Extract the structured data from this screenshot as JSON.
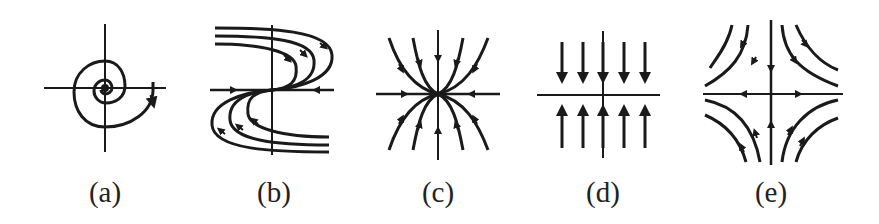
{
  "figure": {
    "panels": [
      {
        "id": "a",
        "label": "(a)",
        "label_x": 105,
        "label_y": 176,
        "type": "spiral-sink"
      },
      {
        "id": "b",
        "label": "(b)",
        "label_x": 274,
        "label_y": 176,
        "type": "saddle-node"
      },
      {
        "id": "c",
        "label": "(c)",
        "label_x": 438,
        "label_y": 176,
        "type": "stable-node"
      },
      {
        "id": "d",
        "label": "(d)",
        "label_x": 603,
        "label_y": 176,
        "type": "line-of-equilibria"
      },
      {
        "id": "e",
        "label": "(e)",
        "label_x": 771,
        "label_y": 176,
        "type": "saddle"
      }
    ],
    "stroke_color": "#1a1a1a",
    "background": "#ffffff"
  }
}
